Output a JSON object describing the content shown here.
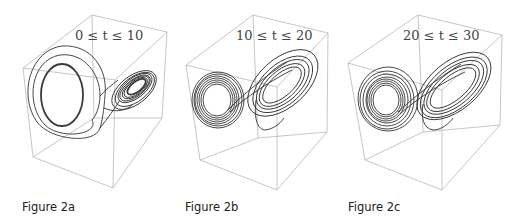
{
  "figure": {
    "panels": [
      {
        "id": "a",
        "caption": "Figure 2a",
        "time_range_label": "0 ≤ t ≤ 10",
        "t_min": 0,
        "t_max": 10
      },
      {
        "id": "b",
        "caption": "Figure 2b",
        "time_range_label": "10 ≤ t ≤ 20",
        "t_min": 10,
        "t_max": 20
      },
      {
        "id": "c",
        "caption": "Figure 2c",
        "time_range_label": "20 ≤ t ≤ 30",
        "t_min": 20,
        "t_max": 30
      }
    ]
  },
  "colors": {
    "box_edges": "#b8b8b8",
    "trajectory": "#333333",
    "caption_text": "#222222"
  }
}
